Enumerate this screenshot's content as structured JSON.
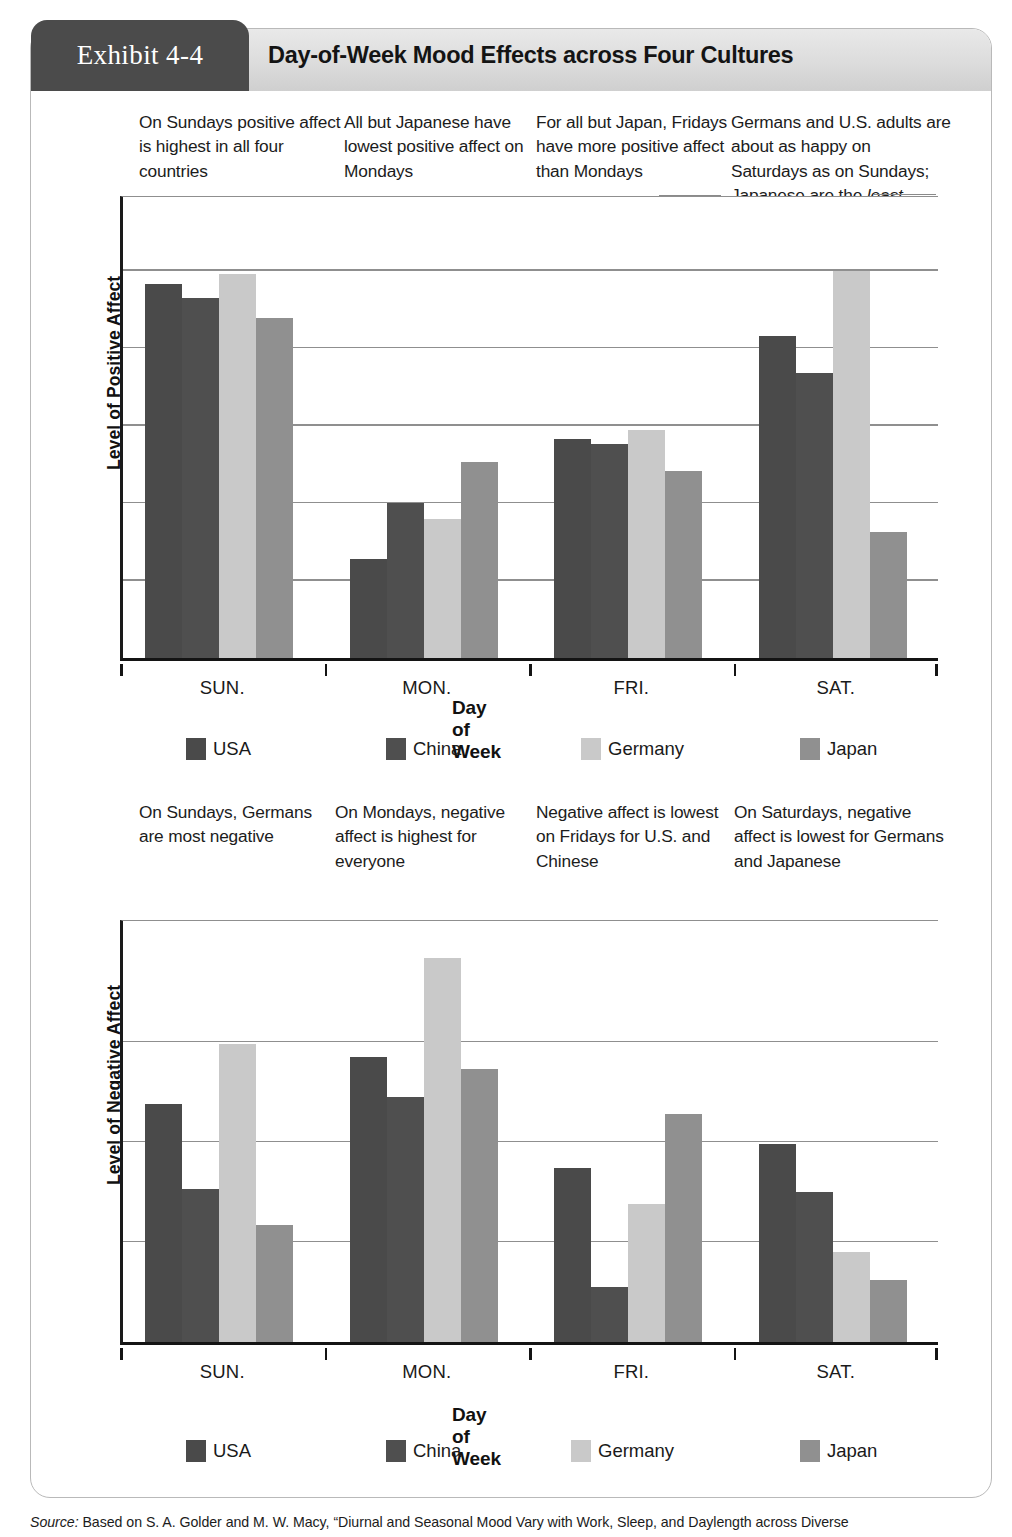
{
  "exhibit": {
    "tab_label": "Exhibit 4-4",
    "title": "Day-of-Week Mood Effects across Four Cultures"
  },
  "notes_top": [
    "On Sundays positive affect is highest in all four countries",
    "All but Japanese have lowest positive affect on Mondays",
    "For all but Japan, Fridays have more positive affect than Mondays",
    "Germans and U.S. adults are about as happy on Saturdays as on Sundays; Japanese are the least happy"
  ],
  "notes_mid": [
    "On Sundays, Germans are most negative",
    "On Mondays, negative affect is highest for everyone",
    "Negative affect is lowest on Fridays for U.S. and Chinese",
    "On Saturdays, negative affect is lowest for Germans and Japanese"
  ],
  "colors": {
    "usa": "#4a4a4a",
    "china": "#4f4f4f",
    "germany": "#c9c9c9",
    "japan": "#909090",
    "gridline": "#8f8f8f",
    "axis": "#141414",
    "tab_background": "#4b4b4b",
    "header_background": "#dcdcdc"
  },
  "legend": {
    "items": [
      {
        "label": "USA",
        "color_key": "usa"
      },
      {
        "label": "China",
        "color_key": "china"
      },
      {
        "label": "Germany",
        "color_key": "germany"
      },
      {
        "label": "Japan",
        "color_key": "japan"
      }
    ]
  },
  "source": {
    "prefix": "Source:",
    "text": " Based on S. A. Golder and M. W. Macy, “Diurnal and Seasonal Mood Vary with Work, Sleep, and Daylength across Diverse"
  },
  "chart_data": [
    {
      "id": "positive-affect",
      "type": "bar",
      "title": "",
      "xlabel": "Day of Week",
      "ylabel": "Level of Positive Affect",
      "categories": [
        "SUN.",
        "MON.",
        "FRI.",
        "SAT."
      ],
      "ylim": [
        0,
        6
      ],
      "grid": true,
      "gridlines": [
        1,
        2,
        3,
        4,
        5
      ],
      "legend_position": "bottom",
      "series": [
        {
          "name": "USA",
          "color_key": "usa",
          "values": [
            4.83,
            1.28,
            2.82,
            4.15
          ]
        },
        {
          "name": "China",
          "color_key": "china",
          "values": [
            4.65,
            2.0,
            2.76,
            3.68
          ]
        },
        {
          "name": "Germany",
          "color_key": "germany",
          "values": [
            4.95,
            1.79,
            2.94,
            5.0
          ]
        },
        {
          "name": "Japan",
          "color_key": "japan",
          "values": [
            4.39,
            2.53,
            2.41,
            1.62
          ]
        }
      ]
    },
    {
      "id": "negative-affect",
      "type": "bar",
      "title": "",
      "xlabel": "Day of Week",
      "ylabel": "Level of Negative Affect",
      "categories": [
        "SUN.",
        "MON.",
        "FRI.",
        "SAT."
      ],
      "ylim": [
        0,
        4.25
      ],
      "grid": true,
      "gridlines": [
        1,
        2,
        3
      ],
      "legend_position": "bottom",
      "series": [
        {
          "name": "USA",
          "color_key": "usa",
          "values": [
            2.38,
            2.85,
            1.74,
            1.98
          ]
        },
        {
          "name": "China",
          "color_key": "china",
          "values": [
            1.53,
            2.45,
            0.55,
            1.5
          ]
        },
        {
          "name": "Germany",
          "color_key": "germany",
          "values": [
            2.98,
            3.84,
            1.38,
            0.9
          ]
        },
        {
          "name": "Japan",
          "color_key": "japan",
          "values": [
            1.17,
            2.73,
            2.28,
            0.62
          ]
        }
      ]
    }
  ]
}
